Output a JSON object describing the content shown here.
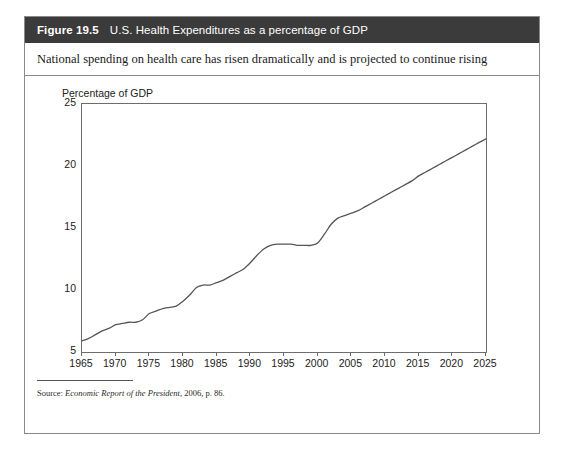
{
  "figure": {
    "number_label": "Figure 19.5",
    "title": "U.S. Health Expenditures as a percentage of GDP",
    "subtitle": "National spending on health care has risen dramatically and is projected to continue rising",
    "source_prefix": "Source:",
    "source_italic": "Economic Report of the President",
    "source_suffix": ", 2006, p. 86.",
    "header_bg": "#3b3b3b",
    "header_fg": "#ffffff",
    "border_color": "#8a8a8a",
    "line_color": "#555555"
  },
  "chart_data": {
    "type": "line",
    "title": "U.S. Health Expenditures as a percentage of GDP",
    "subtitle": "National spending on health care has risen dramatically and is projected to continue rising",
    "xlabel": "",
    "ylabel": "Percentage of GDP",
    "ylabel_position": "above-axis",
    "xlim": [
      1965,
      2025
    ],
    "ylim": [
      5,
      25
    ],
    "xticks": [
      1965,
      1970,
      1975,
      1980,
      1985,
      1990,
      1995,
      2000,
      2005,
      2010,
      2015,
      2020,
      2025
    ],
    "yticks": [
      5,
      10,
      15,
      20,
      25
    ],
    "xtick_labels": [
      "1965",
      "1970",
      "1975",
      "1980",
      "1985",
      "1990",
      "1995",
      "2000",
      "2005",
      "2010",
      "2015",
      "2020",
      "2025"
    ],
    "ytick_labels": [
      "5",
      "10",
      "15",
      "20",
      "25"
    ],
    "grid": false,
    "legend": false,
    "series": [
      {
        "name": "U.S. Health Expenditures (% of GDP)",
        "color": "#555555",
        "x": [
          1965,
          1966,
          1967,
          1968,
          1969,
          1970,
          1971,
          1972,
          1973,
          1974,
          1975,
          1976,
          1977,
          1978,
          1979,
          1980,
          1981,
          1982,
          1983,
          1984,
          1985,
          1986,
          1987,
          1988,
          1989,
          1990,
          1991,
          1992,
          1993,
          1994,
          1995,
          1996,
          1997,
          1998,
          1999,
          2000,
          2001,
          2002,
          2003,
          2004,
          2005,
          2006,
          2007,
          2008,
          2009,
          2010,
          2011,
          2012,
          2013,
          2014,
          2015,
          2016,
          2017,
          2018,
          2019,
          2020,
          2021,
          2022,
          2023,
          2024,
          2025
        ],
        "y": [
          5.9,
          6.1,
          6.4,
          6.7,
          6.9,
          7.2,
          7.3,
          7.4,
          7.4,
          7.6,
          8.1,
          8.3,
          8.5,
          8.6,
          8.7,
          9.1,
          9.6,
          10.2,
          10.4,
          10.4,
          10.6,
          10.8,
          11.1,
          11.4,
          11.7,
          12.2,
          12.8,
          13.3,
          13.6,
          13.7,
          13.7,
          13.7,
          13.6,
          13.6,
          13.6,
          13.8,
          14.5,
          15.3,
          15.8,
          16.0,
          16.2,
          16.4,
          16.7,
          17.0,
          17.3,
          17.6,
          17.9,
          18.2,
          18.5,
          18.8,
          19.2,
          19.5,
          19.8,
          20.1,
          20.4,
          20.7,
          21.0,
          21.3,
          21.6,
          21.9,
          22.2
        ]
      }
    ],
    "annotations": []
  }
}
